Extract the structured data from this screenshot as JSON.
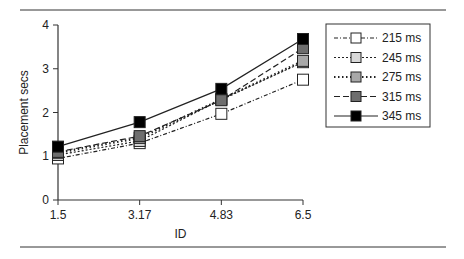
{
  "chart_data": {
    "type": "line",
    "title": "",
    "xlabel": "ID",
    "ylabel": "Placement secs",
    "x": [
      1.5,
      3.17,
      4.83,
      6.5
    ],
    "x_tick_labels": [
      "1.5",
      "3.17",
      "4.83",
      "6.5"
    ],
    "y_ticks": [
      0,
      1,
      2,
      3,
      4
    ],
    "ylim": [
      0,
      4
    ],
    "grid": false,
    "legend_position": "upper right, outside plot",
    "series": [
      {
        "name": "215 ms",
        "values": [
          0.95,
          1.3,
          1.97,
          2.75
        ],
        "marker_fill": "#ffffff",
        "dash": "4,2,1,2"
      },
      {
        "name": "245 ms",
        "values": [
          1.03,
          1.35,
          2.3,
          3.15
        ],
        "marker_fill": "#d8d8d8",
        "dash": "2,2"
      },
      {
        "name": "275 ms",
        "values": [
          1.08,
          1.42,
          2.3,
          3.18
        ],
        "marker_fill": "#a8a8a8",
        "dash": "1.5,2.5"
      },
      {
        "name": "315 ms",
        "values": [
          1.1,
          1.46,
          2.28,
          3.47
        ],
        "marker_fill": "#6e6e6e",
        "dash": "6,3"
      },
      {
        "name": "345 ms",
        "values": [
          1.22,
          1.78,
          2.54,
          3.68
        ],
        "marker_fill": "#000000",
        "dash": ""
      }
    ]
  }
}
